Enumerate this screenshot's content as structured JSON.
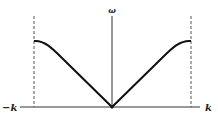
{
  "diagram": {
    "y_axis_label": "ω",
    "x_axis_left_label": "−k",
    "x_axis_right_label": "k",
    "curve": "ω ∝ |sin(ka/2)|, linear near origin, flat at zone boundary",
    "zone_boundaries": "dashed vertical lines at ±k"
  },
  "colors": {
    "line": "#111111",
    "dashed": "#555555",
    "background": "#ffffff"
  }
}
